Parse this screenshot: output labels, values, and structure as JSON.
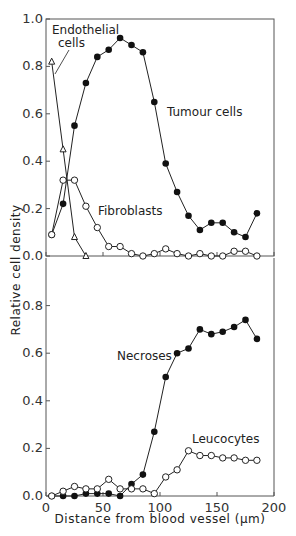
{
  "chart_data": [
    {
      "type": "line",
      "panel": "top",
      "xlabel": "",
      "ylabel": "Relative cell density",
      "xlim": [
        0,
        200
      ],
      "ylim": [
        0,
        1.0
      ],
      "yticks": [
        "0.0",
        "0.2",
        "0.4",
        "0.6",
        "0.8",
        "1.0"
      ],
      "xticks": [
        0,
        50,
        100,
        150,
        200
      ],
      "grid": false,
      "series": [
        {
          "name": "Tumour cells",
          "marker": "filled-circle",
          "x": [
            5,
            15,
            25,
            35,
            45,
            55,
            65,
            75,
            85,
            95,
            105,
            115,
            125,
            135,
            145,
            155,
            165,
            175,
            185
          ],
          "y": [
            0.09,
            0.22,
            0.55,
            0.73,
            0.84,
            0.87,
            0.92,
            0.89,
            0.86,
            0.65,
            0.39,
            0.27,
            0.17,
            0.11,
            0.14,
            0.14,
            0.1,
            0.08,
            0.18
          ]
        },
        {
          "name": "Fibroblasts",
          "marker": "open-circle",
          "x": [
            5,
            15,
            25,
            35,
            45,
            55,
            65,
            75,
            85,
            95,
            105,
            115,
            125,
            135,
            145,
            155,
            165,
            175,
            185
          ],
          "y": [
            0.09,
            0.32,
            0.32,
            0.21,
            0.12,
            0.04,
            0.04,
            0.01,
            0.0,
            0.01,
            0.03,
            0.01,
            0.0,
            0.01,
            0.0,
            0.0,
            0.02,
            0.02,
            0.0
          ]
        },
        {
          "name": "Endothelial cells",
          "marker": "open-triangle",
          "x": [
            5,
            15,
            25,
            35
          ],
          "y": [
            0.82,
            0.45,
            0.08,
            0.0
          ]
        }
      ],
      "annotations": [
        "Endothelial cells",
        "Tumour cells",
        "Fibroblasts"
      ]
    },
    {
      "type": "line",
      "panel": "bottom",
      "xlabel": "Distance from blood vessel (µm)",
      "ylabel": "Relative cell density",
      "xlim": [
        0,
        200
      ],
      "ylim": [
        0,
        1.0
      ],
      "yticks": [
        "0.0",
        "0.2",
        "0.4",
        "0.6",
        "0.8"
      ],
      "xticks": [
        0,
        50,
        100,
        150,
        200
      ],
      "grid": false,
      "series": [
        {
          "name": "Necroses",
          "marker": "filled-circle",
          "x": [
            5,
            15,
            25,
            35,
            45,
            55,
            65,
            75,
            85,
            95,
            105,
            115,
            125,
            135,
            145,
            155,
            165,
            175,
            185
          ],
          "y": [
            0.0,
            0.0,
            0.0,
            0.01,
            0.01,
            0.01,
            0.0,
            0.05,
            0.09,
            0.27,
            0.5,
            0.6,
            0.62,
            0.7,
            0.68,
            0.69,
            0.71,
            0.74,
            0.66
          ]
        },
        {
          "name": "Leucocytes",
          "marker": "open-circle",
          "x": [
            5,
            15,
            25,
            35,
            45,
            55,
            65,
            75,
            85,
            95,
            105,
            115,
            125,
            135,
            145,
            155,
            165,
            175,
            185
          ],
          "y": [
            0.0,
            0.02,
            0.04,
            0.03,
            0.03,
            0.07,
            0.03,
            0.03,
            0.03,
            0.01,
            0.08,
            0.11,
            0.19,
            0.17,
            0.17,
            0.16,
            0.16,
            0.15,
            0.15
          ]
        }
      ],
      "annotations": [
        "Necroses",
        "Leucocytes"
      ]
    }
  ],
  "labels": {
    "ylabel": "Relative cell density",
    "xlabel": "Distance from blood vessel (µm)",
    "top_yticks": [
      "0.0",
      "0.2",
      "0.4",
      "0.6",
      "0.8",
      "1.0"
    ],
    "bottom_yticks": [
      "0.0",
      "0.2",
      "0.4",
      "0.6",
      "0.8"
    ],
    "xticks": [
      "0",
      "50",
      "100",
      "150",
      "200"
    ],
    "ann_endothelial_1": "Endothelial",
    "ann_endothelial_2": "cells",
    "ann_tumour": "Tumour cells",
    "ann_fibroblasts": "Fibroblasts",
    "ann_necroses": "Necroses",
    "ann_leucocytes": "Leucocytes"
  }
}
